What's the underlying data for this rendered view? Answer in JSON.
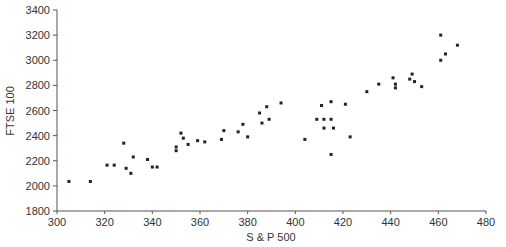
{
  "chart_data": {
    "type": "scatter",
    "title": "",
    "xlabel": "S & P 500",
    "ylabel": "FTSE 100",
    "xlim": [
      300,
      480
    ],
    "ylim": [
      1800,
      3400
    ],
    "xticks": [
      300,
      320,
      340,
      360,
      380,
      400,
      420,
      440,
      460,
      480
    ],
    "yticks": [
      1800,
      2000,
      2200,
      2400,
      2600,
      2800,
      3000,
      3200,
      3400
    ],
    "grid": false,
    "legend": null,
    "marker_color": "#222222",
    "points": [
      {
        "x": 305,
        "y": 2035
      },
      {
        "x": 314,
        "y": 2035
      },
      {
        "x": 321,
        "y": 2165
      },
      {
        "x": 324,
        "y": 2165
      },
      {
        "x": 328,
        "y": 2340
      },
      {
        "x": 329,
        "y": 2140
      },
      {
        "x": 331,
        "y": 2100
      },
      {
        "x": 332,
        "y": 2230
      },
      {
        "x": 338,
        "y": 2210
      },
      {
        "x": 340,
        "y": 2150
      },
      {
        "x": 342,
        "y": 2150
      },
      {
        "x": 350,
        "y": 2280
      },
      {
        "x": 350,
        "y": 2310
      },
      {
        "x": 352,
        "y": 2420
      },
      {
        "x": 353,
        "y": 2380
      },
      {
        "x": 355,
        "y": 2330
      },
      {
        "x": 359,
        "y": 2360
      },
      {
        "x": 362,
        "y": 2350
      },
      {
        "x": 369,
        "y": 2370
      },
      {
        "x": 370,
        "y": 2440
      },
      {
        "x": 376,
        "y": 2430
      },
      {
        "x": 378,
        "y": 2490
      },
      {
        "x": 380,
        "y": 2390
      },
      {
        "x": 385,
        "y": 2580
      },
      {
        "x": 386,
        "y": 2500
      },
      {
        "x": 388,
        "y": 2630
      },
      {
        "x": 389,
        "y": 2530
      },
      {
        "x": 394,
        "y": 2660
      },
      {
        "x": 404,
        "y": 2370
      },
      {
        "x": 409,
        "y": 2530
      },
      {
        "x": 411,
        "y": 2640
      },
      {
        "x": 412,
        "y": 2530
      },
      {
        "x": 412,
        "y": 2460
      },
      {
        "x": 415,
        "y": 2530
      },
      {
        "x": 415,
        "y": 2670
      },
      {
        "x": 416,
        "y": 2460
      },
      {
        "x": 415,
        "y": 2250
      },
      {
        "x": 421,
        "y": 2650
      },
      {
        "x": 423,
        "y": 2390
      },
      {
        "x": 430,
        "y": 2750
      },
      {
        "x": 435,
        "y": 2810
      },
      {
        "x": 441,
        "y": 2860
      },
      {
        "x": 442,
        "y": 2810
      },
      {
        "x": 442,
        "y": 2780
      },
      {
        "x": 449,
        "y": 2890
      },
      {
        "x": 448,
        "y": 2850
      },
      {
        "x": 450,
        "y": 2830
      },
      {
        "x": 453,
        "y": 2790
      },
      {
        "x": 461,
        "y": 3000
      },
      {
        "x": 461,
        "y": 3200
      },
      {
        "x": 463,
        "y": 3050
      },
      {
        "x": 468,
        "y": 3120
      }
    ]
  }
}
